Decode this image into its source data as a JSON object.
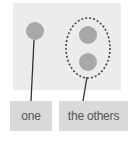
{
  "diagram": {
    "labels": {
      "one": "one",
      "others": "the others"
    },
    "colors": {
      "panel": "#ececec",
      "circle": "#a8a8a8",
      "line": "#333333",
      "dashed_ellipse": "#444444",
      "label_box": "#d9d9d9",
      "label_text": "#555555"
    },
    "nodes": [
      {
        "id": "single",
        "shape": "circle",
        "group": "one"
      },
      {
        "id": "other-1",
        "shape": "circle",
        "group": "the others"
      },
      {
        "id": "other-2",
        "shape": "circle",
        "group": "the others"
      }
    ],
    "group_outline": "dashed-ellipse"
  }
}
